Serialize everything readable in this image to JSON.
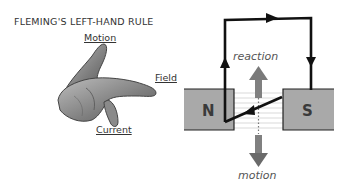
{
  "title": "FLEMING'S LEFT-HAND RULE",
  "hand": {
    "labels": {
      "motion": "Motion",
      "field": "Field",
      "current": "Current"
    }
  },
  "motor": {
    "poles": {
      "north": "N",
      "south": "S"
    },
    "labels": {
      "reaction": "reaction",
      "motion": "motion"
    }
  },
  "colors": {
    "magnet": "#a9a9a9",
    "wire": "#111111",
    "arrow": "#7a7a7a",
    "field_lines": "#cfcfcf",
    "hand": "#8c8c8c"
  }
}
